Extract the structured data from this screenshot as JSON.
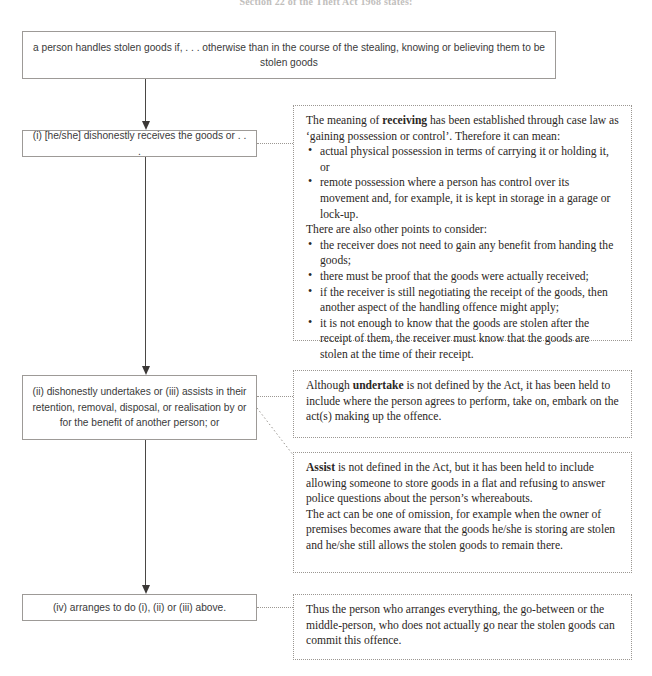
{
  "page": {
    "heading": "Section 22 of the Theft Act 1968 states:"
  },
  "diagram": {
    "type": "flowchart",
    "flow_boxes": [
      {
        "id": "statute",
        "text": "a person handles stolen goods if, . . . otherwise than in the course of the stealing, knowing or believing them to be stolen goods"
      },
      {
        "id": "limb-i",
        "text": "(i) [he/she] dishonestly receives the goods or . . ."
      },
      {
        "id": "limb-ii-iii",
        "text": "(ii) dishonestly undertakes or (iii) assists in their retention, removal, disposal, or realisation by or for the benefit of another person; or"
      },
      {
        "id": "limb-iv",
        "text": "(iv) arranges to do (i), (ii) or (iii) above."
      }
    ],
    "note_boxes": [
      {
        "id": "note-receiving",
        "lead_prefix": "The meaning of ",
        "lead_bold": "receiving",
        "lead_suffix": " has been established through case law as ‘gaining possession or control’. Therefore it can mean:",
        "bullets_1": [
          "actual physical possession in terms of carrying it or holding it, or",
          "remote possession where a person has control over its movement and, for example, it is kept in storage in a garage or lock-up."
        ],
        "mid_text": "There are also other points to consider:",
        "bullets_2": [
          "the receiver does not need to gain any benefit from handing the goods;",
          "there must be proof that the goods were actually received;",
          "if the receiver is still negotiating the receipt of the goods, then another aspect of the handling offence might apply;",
          "it is not enough to know that the goods are stolen after the receipt of them, the receiver must know that the goods are stolen at the time of their receipt."
        ]
      },
      {
        "id": "note-undertake",
        "lead_prefix": "Although ",
        "lead_bold": "undertake",
        "lead_suffix": " is not defined by the Act, it has been held to include where the person agrees to perform, take on, embark on the act(s) making up the offence."
      },
      {
        "id": "note-assist",
        "lead_bold": "Assist",
        "lead_suffix": " is not defined in the Act, but it has been held to include allowing someone to store goods in a flat and refusing to answer police questions about the person’s whereabouts.",
        "para_2": "The act can be one of omission, for example when the owner of premises becomes aware that the goods he/she is storing are stolen and he/she still allows the stolen goods to remain there."
      },
      {
        "id": "note-arranges",
        "lead_suffix": "Thus the person who arranges everything, the go-between or the middle-person, who does not actually go near the stolen goods can commit this offence."
      }
    ],
    "colors": {
      "flow_border": "#9d9a97",
      "note_border": "#9b9792",
      "arrow": "#3b3836",
      "text": "#2b2724",
      "background": "#ffffff"
    }
  }
}
